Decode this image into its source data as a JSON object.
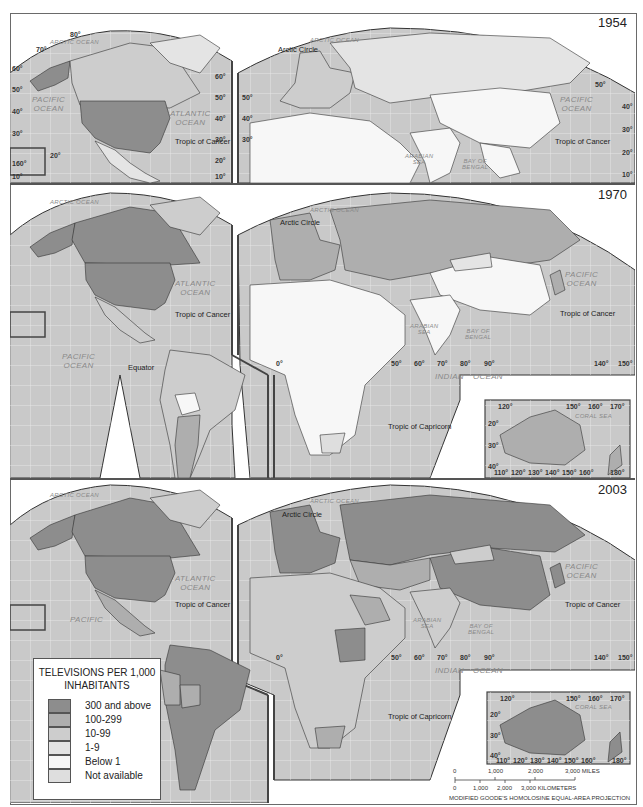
{
  "figure": {
    "title": "Televisions per 1,000 inhabitants",
    "projection": "MODIFIED GOODE'S HOMOLOSINE EQUAL-AREA PROJECTION"
  },
  "colors": {
    "ocean": "#c9c9c9",
    "graticule": "#ececec",
    "border": "#3a3a3a",
    "class_300_above": "#8d8d8d",
    "class_100_299": "#aeaeae",
    "class_10_99": "#cdcdcd",
    "class_1_9": "#e4e4e4",
    "class_below_1": "#f7f7f7",
    "class_na": "#dedede"
  },
  "panels": [
    {
      "year": "1954",
      "labels": {
        "arctic_ocean": "ARCTIC OCEAN",
        "arctic_circle": "Arctic Circle",
        "pacific_ocean_w": [
          "PACIFIC",
          "OCEAN"
        ],
        "atlantic_ocean": [
          "ATLANTIC",
          "OCEAN"
        ],
        "pacific_ocean_e": [
          "PACIFIC",
          "OCEAN"
        ],
        "arabian_sea": [
          "ARABIAN",
          "SEA"
        ],
        "bay_of_bengal": [
          "BAY OF",
          "BENGAL"
        ],
        "tropic_cancer_w": "Tropic of Cancer",
        "tropic_cancer_e": "Tropic of Cancer"
      },
      "lat_ticks_left": [
        "80°",
        "70°",
        "60°",
        "50°",
        "40°",
        "30°",
        "20°",
        "160°",
        "10°"
      ],
      "lat_ticks_mid": [
        "60°",
        "50°",
        "40°",
        "30°",
        "20°",
        "10°"
      ],
      "lat_ticks_right": [
        "50°",
        "40°",
        "30°",
        "20°",
        "10°"
      ],
      "countries": {
        "united_states": "300 and above",
        "alaska": "300 and above",
        "canada": "10-99",
        "mexico": "1-9",
        "europe_west": "10-99",
        "ussr": "1-9",
        "china": "Below 1",
        "india": "Below 1",
        "africa": "Below 1",
        "middle_east": "Below 1"
      }
    },
    {
      "year": "1970",
      "labels": {
        "arctic_ocean": "ARCTIC OCEAN",
        "arctic_circle": "Arctic Circle",
        "pacific_ocean_w": [
          "PACIFIC",
          "OCEAN"
        ],
        "atlantic_ocean": [
          "ATLANTIC",
          "OCEAN"
        ],
        "pacific_ocean_e": [
          "PACIFIC",
          "OCEAN"
        ],
        "arabian_sea": [
          "ARABIAN",
          "SEA"
        ],
        "bay_of_bengal": [
          "BAY OF",
          "BENGAL"
        ],
        "indian_ocean": [
          "INDIAN",
          "OCEAN"
        ],
        "coral_sea": "CORAL SEA",
        "equator": "Equator",
        "tropic_cancer_w": "Tropic of Cancer",
        "tropic_cancer_e": "Tropic of Cancer",
        "tropic_capricorn": "Tropic of Capricorn"
      },
      "lon_ticks": [
        "0°",
        "50°",
        "60°",
        "70°",
        "80°",
        "90°",
        "140°",
        "150°"
      ],
      "australia_inset": {
        "lon_top": [
          "120°",
          "150°",
          "160°",
          "170°"
        ],
        "lon_bottom": [
          "110°",
          "120°",
          "130°",
          "140°",
          "150°",
          "160°",
          "180°"
        ],
        "lat": [
          "20°",
          "30°",
          "40°"
        ]
      },
      "countries": {
        "united_states": "300 and above",
        "canada": "300 and above",
        "alaska": "300 and above",
        "mexico": "10-99",
        "south_america": "10-99",
        "bolivia": "1-9",
        "argentina": "100-299",
        "europe_west": "100-299",
        "ussr": "100-299",
        "china": "Below 1",
        "india": "Below 1",
        "africa": "Below 1",
        "south_africa": "Not available",
        "australia": "100-299",
        "japan": "100-299"
      }
    },
    {
      "year": "2003",
      "labels": {
        "arctic_ocean": "ARCTIC OCEAN",
        "arctic_circle": "Arctic Circle",
        "pacific_ocean_w": [
          "PACIFIC",
          "OCEAN"
        ],
        "atlantic_ocean": [
          "ATLANTIC",
          "OCEAN"
        ],
        "pacific_ocean_e": [
          "PACIFIC",
          "OCEAN"
        ],
        "arabian_sea": [
          "ARABIAN",
          "SEA"
        ],
        "bay_of_bengal": [
          "BAY OF",
          "BENGAL"
        ],
        "indian_ocean": [
          "INDIAN",
          "OCEAN"
        ],
        "coral_sea": "CORAL SEA",
        "tropic_cancer_w": "Tropic of Cancer",
        "tropic_cancer_e": "Tropic of Cancer",
        "tropic_capricorn": "Tropic of Capricorn"
      },
      "lon_ticks": [
        "0°",
        "50°",
        "60°",
        "70°",
        "80°",
        "90°",
        "140°",
        "150°"
      ],
      "australia_inset": {
        "lon_top": [
          "120°",
          "150°",
          "160°",
          "170°"
        ],
        "lon_bottom": [
          "110°",
          "120°",
          "130°",
          "140°",
          "150°",
          "160°",
          "180°"
        ],
        "lat": [
          "20°",
          "30°",
          "40°"
        ]
      },
      "countries": {
        "united_states": "300 and above",
        "canada": "300 and above",
        "alaska": "300 and above",
        "greenland": "10-99",
        "mexico": "100-299",
        "brazil": "300 and above",
        "colombia": "300 and above",
        "argentina": "300 and above",
        "peru": "100-299",
        "bolivia": "100-299",
        "europe_west": "300 and above",
        "russia": "300 and above",
        "china": "300 and above",
        "mongolia": "10-99",
        "sudan": "300 and above",
        "india": "10-99",
        "africa": "10-99",
        "south_africa": "100-299",
        "australia": "300 and above",
        "japan": "300 and above",
        "new_zealand": "300 and above"
      }
    }
  ],
  "legend": {
    "title_line1": "TELEVISIONS PER 1,000",
    "title_line2": "INHABITANTS",
    "items": [
      {
        "label": "300 and above",
        "color": "#8d8d8d"
      },
      {
        "label": "100-299",
        "color": "#aeaeae"
      },
      {
        "label": "10-99",
        "color": "#cdcdcd"
      },
      {
        "label": "1-9",
        "color": "#e4e4e4"
      },
      {
        "label": "Below 1",
        "color": "#f7f7f7"
      },
      {
        "label": "Not available",
        "color": "#dedede"
      }
    ]
  },
  "scale_bar": {
    "miles": [
      "0",
      "1,000",
      "2,000",
      "3,000 MILES"
    ],
    "kilometers": [
      "0",
      "1,000",
      "2,000",
      "3,000 KILOMETERS"
    ]
  }
}
